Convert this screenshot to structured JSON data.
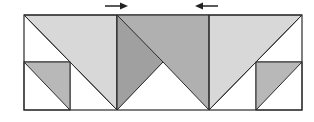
{
  "diagram": {
    "colors": {
      "background": "#ffffff",
      "stroke": "#2a2a2a",
      "light_fill": "#d6d6d6",
      "medium_fill": "#b8b8b8",
      "dark_fill": "#9e9e9e"
    },
    "arrows": [
      {
        "direction": "right",
        "label": "right-arrow"
      },
      {
        "direction": "left",
        "label": "left-arrow"
      }
    ]
  }
}
